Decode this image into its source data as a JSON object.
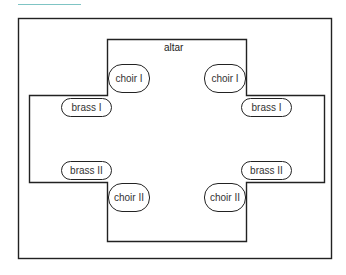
{
  "diagram": {
    "title_rule_color": "#7fc4c4",
    "stroke_color": "#222222",
    "altar_label": "altar",
    "positions": [
      {
        "id": "choir-1-left",
        "label": "choir I",
        "kind": "choir"
      },
      {
        "id": "choir-1-right",
        "label": "choir I",
        "kind": "choir"
      },
      {
        "id": "brass-1-left",
        "label": "brass I",
        "kind": "brass"
      },
      {
        "id": "brass-1-right",
        "label": "brass I",
        "kind": "brass"
      },
      {
        "id": "brass-2-left",
        "label": "brass II",
        "kind": "brass"
      },
      {
        "id": "brass-2-right",
        "label": "brass II",
        "kind": "brass"
      },
      {
        "id": "choir-2-left",
        "label": "choir II",
        "kind": "choir"
      },
      {
        "id": "choir-2-right",
        "label": "choir II",
        "kind": "choir"
      }
    ]
  }
}
